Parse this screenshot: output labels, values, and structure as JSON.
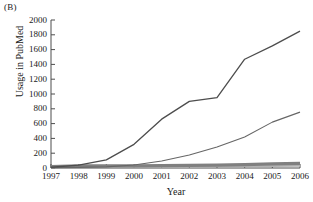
{
  "panel": {
    "label": "(B)"
  },
  "chart_data": {
    "type": "line",
    "title": "",
    "xlabel": "Year",
    "ylabel": "Usage in PubMed",
    "categories": [
      1997,
      1998,
      1999,
      2000,
      2001,
      2002,
      2003,
      2004,
      2005,
      2006
    ],
    "x": [
      "1997",
      "1998",
      "1999",
      "2000",
      "2001",
      "2002",
      "2003",
      "2004",
      "2005",
      "2006"
    ],
    "xlim": [
      1997,
      2006
    ],
    "ylim": [
      0,
      2000
    ],
    "ytick_labels": [
      "0",
      "200",
      "400",
      "600",
      "800",
      "1000",
      "1200",
      "1400",
      "1600",
      "1800",
      "2000"
    ],
    "ytick_values": [
      0,
      200,
      400,
      600,
      800,
      1000,
      1200,
      1400,
      1600,
      1800,
      2000
    ],
    "xtick_labels": [
      "1997",
      "1998",
      "1999",
      "2000",
      "2001",
      "2002",
      "2003",
      "2004",
      "2005",
      "2006"
    ],
    "grid": false,
    "legend": "none",
    "series": [
      {
        "name": "series-1",
        "color": "#4d4d4d",
        "width": 1.3,
        "values": [
          10,
          40,
          110,
          320,
          660,
          900,
          950,
          1470,
          1650,
          1850
        ]
      },
      {
        "name": "series-2",
        "color": "#666666",
        "width": 1.1,
        "values": [
          5,
          8,
          15,
          40,
          95,
          175,
          285,
          420,
          620,
          755
        ]
      },
      {
        "name": "series-3",
        "color": "#808080",
        "width": 3.2,
        "values": [
          18,
          30,
          30,
          30,
          32,
          35,
          38,
          45,
          55,
          62
        ]
      },
      {
        "name": "series-4",
        "color": "#b3b3b3",
        "width": 2.0,
        "values": [
          8,
          12,
          14,
          16,
          18,
          20,
          22,
          25,
          28,
          30
        ]
      }
    ]
  },
  "axes": {
    "spine_color": "#4d4d4d",
    "plot_left": 51,
    "plot_right": 300,
    "plot_top": 20,
    "plot_bottom": 168
  }
}
